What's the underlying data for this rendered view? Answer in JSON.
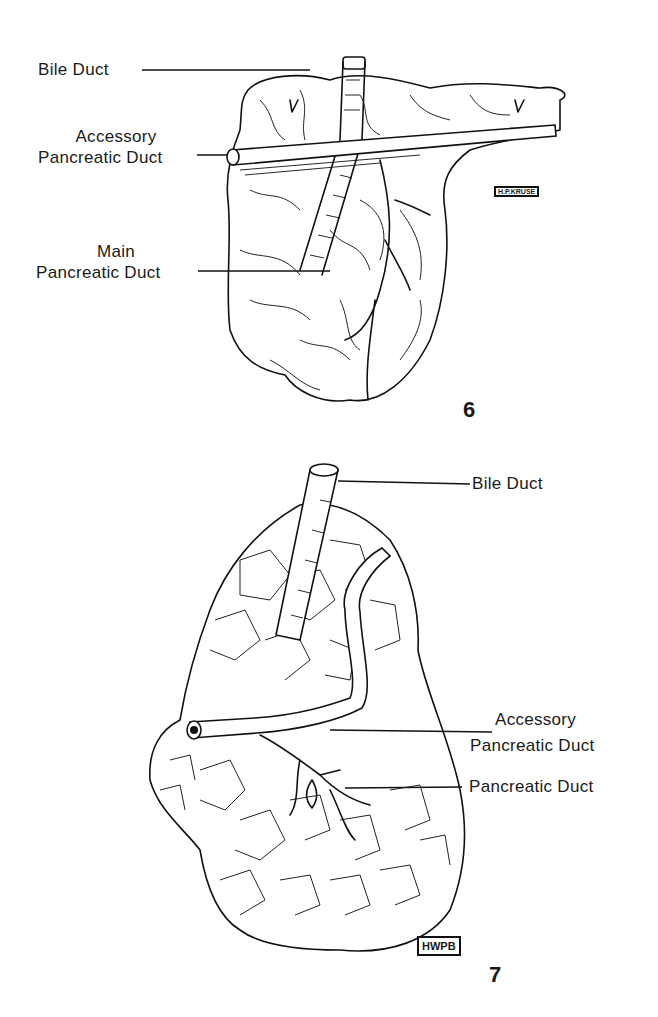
{
  "figures": [
    {
      "number": "6",
      "labels": {
        "bile_duct": "Bile Duct",
        "accessory_line1": "Accessory",
        "accessory_line2": "Pancreatic Duct",
        "main_line1": "Main",
        "main_line2": "Pancreatic Duct"
      },
      "signature": "H.P.KRUSE"
    },
    {
      "number": "7",
      "labels": {
        "bile_duct": "Bile Duct",
        "accessory_line1": "Accessory",
        "accessory_line2": "Pancreatic Duct",
        "pancreatic_duct": "Pancreatic Duct"
      },
      "signature": "HWPB"
    }
  ],
  "colors": {
    "ink": "#111111",
    "paper": "#ffffff"
  }
}
